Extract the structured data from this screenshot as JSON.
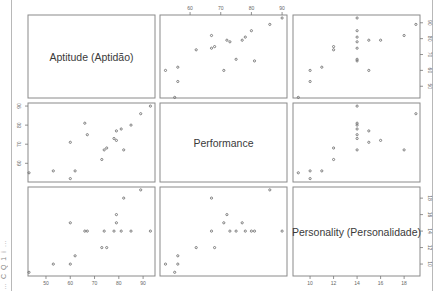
{
  "chart_data": {
    "type": "scatter",
    "subtype": "scatterplot-matrix",
    "title": "",
    "variables": [
      {
        "name": "Aptitude (Aptidão)",
        "key": "aptitude",
        "ticks": [
          50,
          60,
          70,
          80,
          90
        ],
        "range": [
          42.6,
          94.9
        ]
      },
      {
        "name": "Performance",
        "key": "performance",
        "ticks": [
          60,
          70,
          80,
          90
        ],
        "range": [
          50.2,
          91.6
        ]
      },
      {
        "name": "Personality (Personalidade)",
        "key": "personality",
        "ticks": [
          10,
          12,
          14,
          16,
          18
        ],
        "range": [
          8.55,
          19.35
        ]
      }
    ],
    "axis_label_positions": {
      "top": "performance",
      "right_row1": "aptitude",
      "left_row2": "performance",
      "bottom_col1": "aptitude",
      "bottom_col3": "personality",
      "right_row3": "personality"
    },
    "grid": false,
    "legend": null,
    "observations": [
      {
        "aptitude": 43,
        "performance": 55,
        "personality": 9
      },
      {
        "aptitude": 53,
        "performance": 56,
        "personality": 10
      },
      {
        "aptitude": 60,
        "performance": 52,
        "personality": 10
      },
      {
        "aptitude": 62,
        "performance": 56,
        "personality": 11
      },
      {
        "aptitude": 60,
        "performance": 71,
        "personality": 15
      },
      {
        "aptitude": 66,
        "performance": 81,
        "personality": 14
      },
      {
        "aptitude": 67,
        "performance": 75,
        "personality": 14
      },
      {
        "aptitude": 73,
        "performance": 62,
        "personality": 12
      },
      {
        "aptitude": 74,
        "performance": 67,
        "personality": 14
      },
      {
        "aptitude": 75,
        "performance": 68,
        "personality": 12
      },
      {
        "aptitude": 78,
        "performance": 73,
        "personality": 14
      },
      {
        "aptitude": 79,
        "performance": 72,
        "personality": 16
      },
      {
        "aptitude": 79,
        "performance": 77,
        "personality": 15
      },
      {
        "aptitude": 81,
        "performance": 78,
        "personality": 14
      },
      {
        "aptitude": 82,
        "performance": 67,
        "personality": 18
      },
      {
        "aptitude": 85,
        "performance": 80,
        "personality": 14
      },
      {
        "aptitude": 89,
        "performance": 86,
        "personality": 19
      },
      {
        "aptitude": 93,
        "performance": 90,
        "personality": 14
      }
    ]
  },
  "page": {
    "clipped_side_text": "… C Q 1 i …"
  }
}
